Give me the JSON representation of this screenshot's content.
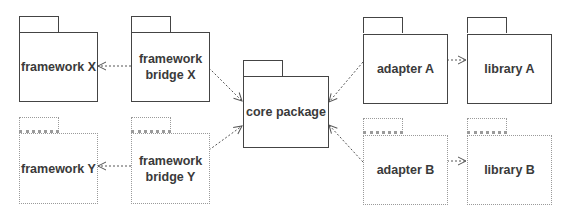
{
  "diagram": {
    "type": "UML package dependency diagram",
    "packages": [
      {
        "id": "framework_x",
        "label": "framework X",
        "style": "solid"
      },
      {
        "id": "framework_bridge_x",
        "label": "framework\nbridge X",
        "style": "solid"
      },
      {
        "id": "core_package",
        "label": "core package",
        "style": "solid"
      },
      {
        "id": "adapter_a",
        "label": "adapter A",
        "style": "solid"
      },
      {
        "id": "library_a",
        "label": "library A",
        "style": "solid"
      },
      {
        "id": "framework_y",
        "label": "framework Y",
        "style": "dotted"
      },
      {
        "id": "framework_bridge_y",
        "label": "framework\nbridge Y",
        "style": "dotted"
      },
      {
        "id": "adapter_b",
        "label": "adapter B",
        "style": "dotted"
      },
      {
        "id": "library_b",
        "label": "library B",
        "style": "dotted"
      }
    ],
    "dependencies": [
      {
        "from": "framework bridge X",
        "to": "framework X"
      },
      {
        "from": "framework bridge X",
        "to": "core package"
      },
      {
        "from": "framework bridge Y",
        "to": "framework Y"
      },
      {
        "from": "framework bridge Y",
        "to": "core package"
      },
      {
        "from": "adapter A",
        "to": "core package"
      },
      {
        "from": "adapter A",
        "to": "library A"
      },
      {
        "from": "adapter B",
        "to": "core package"
      },
      {
        "from": "adapter B",
        "to": "library B"
      }
    ],
    "colors": {
      "solid_border": "#444444",
      "light_border": "#9a9a9a",
      "text": "#3a3a3a",
      "arrow": "#555555"
    }
  }
}
